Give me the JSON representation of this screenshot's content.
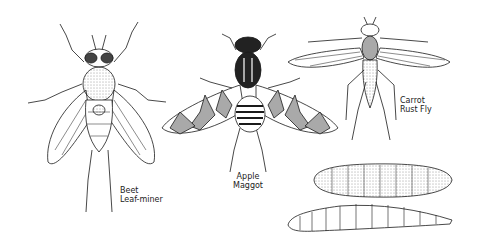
{
  "illustration": {
    "subjects": [
      {
        "id": "beet-leaf-miner",
        "label_line1": "Beet",
        "label_line2": "Leaf-miner"
      },
      {
        "id": "apple-maggot",
        "label_line1": "Apple",
        "label_line2": "Maggot"
      },
      {
        "id": "carrot-rust-fly",
        "label_line1": "Carrot",
        "label_line2": "Rust Fly"
      },
      {
        "id": "pupa",
        "label_line1": "",
        "label_line2": ""
      },
      {
        "id": "larva",
        "label_line1": "",
        "label_line2": ""
      }
    ],
    "colors": {
      "ink": "#1a1a1a",
      "background": "#ffffff"
    }
  }
}
